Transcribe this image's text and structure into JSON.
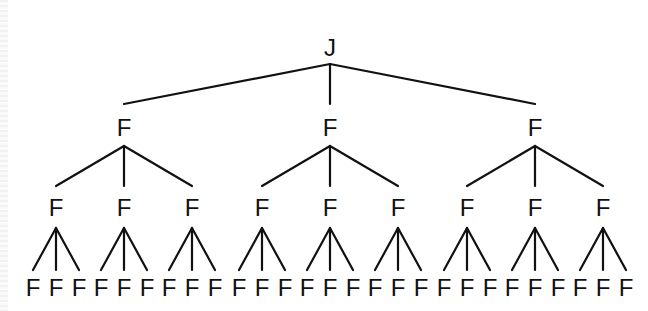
{
  "diagram": {
    "type": "tree",
    "colors": {
      "line": "#111111",
      "text": "#111111",
      "background": "#ffffff"
    },
    "root": {
      "label": "J",
      "children": [
        {
          "label": "F",
          "children": [
            {
              "label": "F",
              "children": [
                {
                  "label": "F"
                },
                {
                  "label": "F"
                },
                {
                  "label": "F"
                }
              ]
            },
            {
              "label": "F",
              "children": [
                {
                  "label": "F"
                },
                {
                  "label": "F"
                },
                {
                  "label": "F"
                }
              ]
            },
            {
              "label": "F",
              "children": [
                {
                  "label": "F"
                },
                {
                  "label": "F"
                },
                {
                  "label": "F"
                }
              ]
            }
          ]
        },
        {
          "label": "F",
          "children": [
            {
              "label": "F",
              "children": [
                {
                  "label": "F"
                },
                {
                  "label": "F"
                },
                {
                  "label": "F"
                }
              ]
            },
            {
              "label": "F",
              "children": [
                {
                  "label": "F"
                },
                {
                  "label": "F"
                },
                {
                  "label": "F"
                }
              ]
            },
            {
              "label": "F",
              "children": [
                {
                  "label": "F"
                },
                {
                  "label": "F"
                },
                {
                  "label": "F"
                }
              ]
            }
          ]
        },
        {
          "label": "F",
          "children": [
            {
              "label": "F",
              "children": [
                {
                  "label": "F"
                },
                {
                  "label": "F"
                },
                {
                  "label": "F"
                }
              ]
            },
            {
              "label": "F",
              "children": [
                {
                  "label": "F"
                },
                {
                  "label": "F"
                },
                {
                  "label": "F"
                }
              ]
            },
            {
              "label": "F",
              "children": [
                {
                  "label": "F"
                },
                {
                  "label": "F"
                },
                {
                  "label": "F"
                }
              ]
            }
          ]
        }
      ]
    }
  }
}
